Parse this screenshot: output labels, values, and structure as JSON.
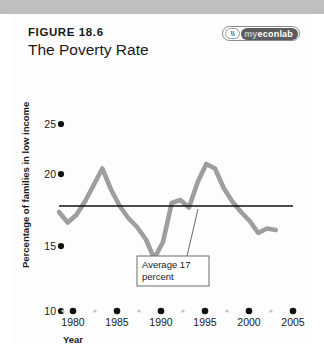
{
  "figure": {
    "number_label": "FIGURE 18.6",
    "title": "The Poverty Rate"
  },
  "logo": {
    "name": "myeconlab-logo",
    "mark_glyph": "\\\\",
    "text_prefix": "my",
    "text_main": "econlab"
  },
  "chart_data": {
    "type": "line",
    "title": "The Poverty Rate",
    "xlabel": "Year",
    "ylabel": "Percentage of families in low income",
    "xlim": [
      1978,
      2005
    ],
    "ylim": [
      10,
      25
    ],
    "xticks": [
      1980,
      1985,
      1990,
      1995,
      2000,
      2005
    ],
    "xtick_labels": [
      "1980",
      "1985",
      "1990",
      "1995",
      "2000",
      "2005"
    ],
    "yticks": [
      10,
      15,
      20,
      25
    ],
    "ytick_labels": [
      "10",
      "15",
      "20",
      "25"
    ],
    "grid": false,
    "legend": "none",
    "series": [
      {
        "name": "Poverty rate",
        "color": "#9e9e9e",
        "x": [
          1978,
          1979,
          1980,
          1981,
          1982,
          1983,
          1984,
          1985,
          1986,
          1987,
          1988,
          1989,
          1990,
          1991,
          1992,
          1993,
          1994,
          1995,
          1996,
          1997,
          1998,
          1999,
          2000,
          2001,
          2002,
          2003
        ],
        "values": [
          16.6,
          15.9,
          16.4,
          17.3,
          18.4,
          19.5,
          18.1,
          17.0,
          16.2,
          15.6,
          14.8,
          13.5,
          14.6,
          17.2,
          17.4,
          16.9,
          18.6,
          19.8,
          19.5,
          18.2,
          17.3,
          16.6,
          16.0,
          15.2,
          15.5,
          15.4
        ]
      }
    ],
    "reference_line": {
      "name": "Average",
      "value": 17,
      "color": "#111111",
      "label_line1": "Average  17",
      "label_line2": "percent"
    }
  },
  "annotation": {
    "line1": "Average  17",
    "line2": "percent"
  },
  "colors": {
    "series": "#9e9e9e",
    "reference": "#111111",
    "text": "#1a1a1a",
    "band": "#bfbfbf",
    "panel": "#fdfdfd"
  }
}
